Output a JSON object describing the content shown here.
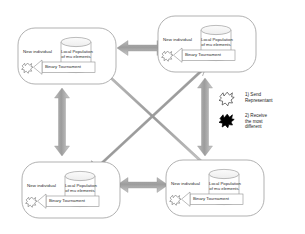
{
  "figure": {
    "kind": "island-model-diagram",
    "background": "#ffffff",
    "arrow_color": "#9a9a9a",
    "node_border_color": "#8f8f8f",
    "text_color": "#2b2b2b"
  },
  "nodes": [
    {
      "id": "island-top-left",
      "new_individual": "New individual",
      "population_line1": "Local Population",
      "population_line2": "of mu elements",
      "tournament": "Binary Tournament"
    },
    {
      "id": "island-top-right",
      "new_individual": "New individual",
      "population_line1": "Local Population",
      "population_line2": "of mu elements",
      "tournament": "Binary Tournament"
    },
    {
      "id": "island-bottom-left",
      "new_individual": "New individual",
      "population_line1": "Local Population",
      "population_line2": "of mu elements",
      "tournament": "Binary Tournament"
    },
    {
      "id": "island-bottom-right",
      "new_individual": "New individual",
      "population_line1": "Local Population",
      "population_line2": "of mu elements",
      "tournament": "Binary Tournament"
    }
  ],
  "legend": {
    "items": [
      {
        "icon": "blob-outline-icon",
        "icon_fill": "#ffffff",
        "text": "1) Send\nRepresentant"
      },
      {
        "icon": "blob-filled-icon",
        "icon_fill": "#000000",
        "text": "2) Receive\nthe most\ndifferent"
      }
    ]
  },
  "connections": [
    {
      "id": "arrow-top-horizontal",
      "from": "island-top-left",
      "to": "island-top-right",
      "style": "double-headed"
    },
    {
      "id": "arrow-bottom-horizontal",
      "from": "island-bottom-left",
      "to": "island-bottom-right",
      "style": "double-headed"
    },
    {
      "id": "arrow-left-vertical",
      "from": "island-top-left",
      "to": "island-bottom-left",
      "style": "double-headed"
    },
    {
      "id": "arrow-right-vertical",
      "from": "island-top-right",
      "to": "island-bottom-right",
      "style": "double-headed"
    },
    {
      "id": "arrow-diagonal-tl-br",
      "from": "island-top-left",
      "to": "island-bottom-right",
      "style": "double-headed"
    },
    {
      "id": "arrow-diagonal-tr-bl",
      "from": "island-top-right",
      "to": "island-bottom-left",
      "style": "double-headed"
    }
  ]
}
